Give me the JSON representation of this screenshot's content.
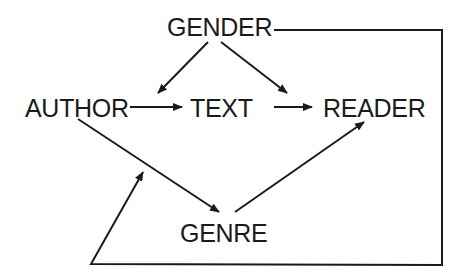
{
  "diagram": {
    "type": "flow-diagram",
    "nodes": {
      "gender": {
        "label": "GENDER"
      },
      "author": {
        "label": "AUTHOR"
      },
      "text": {
        "label": "TEXT"
      },
      "reader": {
        "label": "READER"
      },
      "genre": {
        "label": "GENRE"
      }
    },
    "edges": [
      {
        "from": "GENDER",
        "to": "AUTHOR"
      },
      {
        "from": "GENDER",
        "to": "READER"
      },
      {
        "from": "AUTHOR",
        "to": "TEXT"
      },
      {
        "from": "TEXT",
        "to": "READER"
      },
      {
        "from": "AUTHOR",
        "to": "GENRE"
      },
      {
        "from": "GENRE",
        "to": "READER"
      },
      {
        "from": "GENDER",
        "to": "AUTHOR-GENRE edge",
        "routing": "right side, bottom, up to arrow"
      }
    ],
    "colors": {
      "ink": "#1a1a1a",
      "background": "#ffffff"
    }
  }
}
